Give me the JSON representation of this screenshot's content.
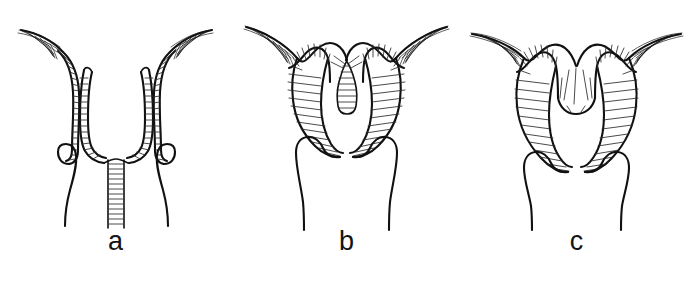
{
  "figure": {
    "domain": "anatomical-line-drawing",
    "background_color": "#ffffff",
    "ink_color": "#111111",
    "width": 692,
    "height": 287,
    "panels": [
      {
        "id": "a",
        "label": "a",
        "label_x": 108,
        "label_y": 258,
        "description": "Uterus with complete median septum extending from fundus to the full length of the cavity; two narrow horns with transverse hatching converge into a long narrow hatched septal band reaching the lower border.",
        "fundus_shape": "convergent-V",
        "septum": "complete",
        "septum_extent_fraction": 1.0,
        "horns": 2,
        "has_fimbrial_flare": true,
        "tube_hatch_count": 46
      },
      {
        "id": "b",
        "label": "b",
        "label_x": 355,
        "label_y": 258,
        "description": "Uterus with short partial (sub-) septum: a small hatched tongue projects downward from the fundal notch into an otherwise single cavity; horns splay widely with broad fimbrial flares.",
        "fundus_shape": "notched-V-with-tongue",
        "septum": "partial",
        "septum_extent_fraction": 0.22,
        "horns": 2,
        "has_fimbrial_flare": true,
        "tube_hatch_count": 44
      },
      {
        "id": "c",
        "label": "c",
        "label_x": 590,
        "label_y": 258,
        "description": "Uterus with smooth arcuate fundal indentation and no septum; the hatched tubal walls sweep in one continuous curve across the fundus into both horns.",
        "fundus_shape": "smooth-arcuate-notch",
        "septum": "none",
        "septum_extent_fraction": 0.0,
        "horns": 2,
        "has_fimbrial_flare": true,
        "tube_hatch_count": 48
      }
    ]
  }
}
